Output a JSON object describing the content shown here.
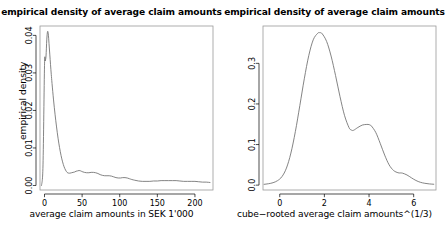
{
  "figure": {
    "background": "#ffffff",
    "line_color": "#6e6e6e",
    "axis_color": "#000000",
    "panels": 2
  },
  "chart_data": [
    {
      "type": "line",
      "panel": "left",
      "title": "empirical density of average claim amounts",
      "xlabel": "average claim amounts in SEK 1'000",
      "ylabel": "empirical density",
      "xticks": [
        "0",
        "50",
        "100",
        "150",
        "200"
      ],
      "xtick_values": [
        0,
        50,
        100,
        150,
        200
      ],
      "yticks": [
        "0.00",
        "0.01",
        "0.02",
        "0.03",
        "0.04"
      ],
      "ytick_values": [
        0.0,
        0.01,
        0.02,
        0.03,
        0.04
      ],
      "xlim": [
        -6,
        224
      ],
      "ylim": [
        -0.0012,
        0.0425
      ],
      "grid": false,
      "legend": "none",
      "series": [
        {
          "name": "empirical density",
          "x": [
            -4,
            -2,
            0,
            1,
            2,
            3,
            4,
            5,
            6,
            7,
            8,
            9,
            10,
            12,
            14,
            16,
            18,
            20,
            22,
            24,
            26,
            28,
            30,
            32,
            34,
            36,
            38,
            40,
            42,
            44,
            46,
            48,
            50,
            53,
            56,
            59,
            62,
            65,
            68,
            71,
            74,
            77,
            80,
            83,
            86,
            89,
            92,
            95,
            98,
            101,
            104,
            107,
            110,
            113,
            116,
            120,
            125,
            130,
            135,
            140,
            145,
            150,
            155,
            160,
            165,
            170,
            175,
            180,
            185,
            190,
            195,
            200,
            205,
            210,
            215,
            220
          ],
          "y": [
            0.0,
            0.0055,
            0.032,
            0.0332,
            0.0345,
            0.0388,
            0.041,
            0.0404,
            0.0378,
            0.035,
            0.0322,
            0.0296,
            0.0272,
            0.0228,
            0.019,
            0.0156,
            0.0126,
            0.0101,
            0.008,
            0.0063,
            0.005,
            0.0041,
            0.0035,
            0.0033,
            0.0033,
            0.0034,
            0.0035,
            0.0036,
            0.0038,
            0.0039,
            0.004,
            0.0039,
            0.0037,
            0.0035,
            0.0034,
            0.0034,
            0.0035,
            0.0035,
            0.0034,
            0.0032,
            0.0029,
            0.0027,
            0.0026,
            0.0026,
            0.0026,
            0.0025,
            0.0023,
            0.0021,
            0.002,
            0.002,
            0.0021,
            0.0021,
            0.002,
            0.0018,
            0.0016,
            0.0014,
            0.0012,
            0.0011,
            0.0011,
            0.0011,
            0.0012,
            0.0012,
            0.0013,
            0.0013,
            0.0013,
            0.0013,
            0.0013,
            0.0012,
            0.0011,
            0.0011,
            0.0011,
            0.0011,
            0.001,
            0.0009,
            0.0009,
            0.0008
          ]
        }
      ]
    },
    {
      "type": "line",
      "panel": "right",
      "title": "empirical density of average claim amounts",
      "xlabel": "cube−rooted average claim amounts^(1/3)",
      "ylabel": "empirical density",
      "xticks": [
        "0",
        "2",
        "4",
        "6"
      ],
      "xtick_values": [
        0,
        2,
        4,
        6
      ],
      "yticks": [
        "0.0",
        "0.1",
        "0.2",
        "0.3"
      ],
      "ytick_values": [
        0.0,
        0.1,
        0.2,
        0.3
      ],
      "xlim": [
        -0.75,
        7.0
      ],
      "ylim": [
        -0.012,
        0.392
      ],
      "grid": false,
      "legend": "none",
      "series": [
        {
          "name": "empirical density",
          "x": [
            -0.7,
            -0.5,
            -0.3,
            -0.1,
            0.1,
            0.3,
            0.5,
            0.7,
            0.9,
            1.1,
            1.3,
            1.5,
            1.7,
            1.8,
            1.9,
            2.1,
            2.3,
            2.5,
            2.7,
            2.9,
            3.1,
            3.2,
            3.3,
            3.5,
            3.7,
            3.9,
            4.0,
            4.1,
            4.3,
            4.5,
            4.7,
            4.9,
            5.1,
            5.3,
            5.4,
            5.5,
            5.7,
            5.9,
            6.1,
            6.3,
            6.5,
            6.7,
            6.9
          ],
          "y": [
            0.002,
            0.0035,
            0.006,
            0.011,
            0.021,
            0.042,
            0.079,
            0.132,
            0.196,
            0.262,
            0.319,
            0.358,
            0.374,
            0.3755,
            0.373,
            0.354,
            0.318,
            0.27,
            0.218,
            0.172,
            0.142,
            0.136,
            0.135,
            0.142,
            0.148,
            0.1495,
            0.149,
            0.146,
            0.13,
            0.103,
            0.074,
            0.05,
            0.036,
            0.0305,
            0.03,
            0.0295,
            0.025,
            0.018,
            0.0115,
            0.007,
            0.0045,
            0.003,
            0.0022
          ]
        }
      ]
    }
  ]
}
